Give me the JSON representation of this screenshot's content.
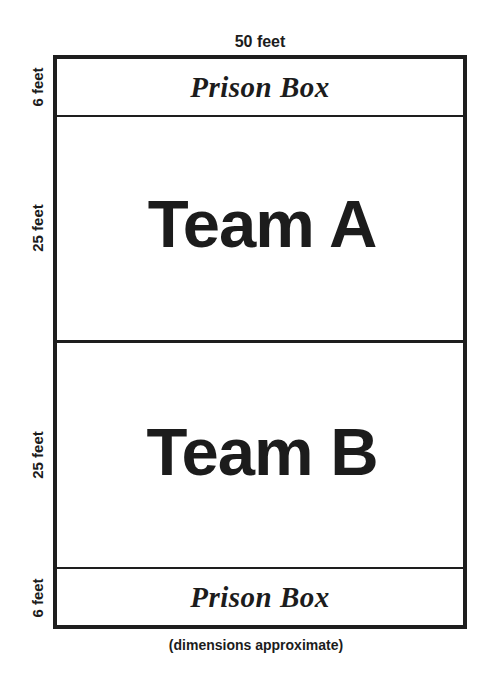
{
  "diagram": {
    "type": "field-layout",
    "dimensions": {
      "width_label": "50 feet",
      "side_labels": [
        "6 feet",
        "25 feet",
        "25 feet",
        "6 feet"
      ]
    },
    "zones": [
      {
        "name": "prison-box-top",
        "label": "Prison Box",
        "depth": "6 feet"
      },
      {
        "name": "team-a",
        "label": "Team A",
        "depth": "25 feet"
      },
      {
        "name": "team-b",
        "label": "Team B",
        "depth": "25 feet"
      },
      {
        "name": "prison-box-bottom",
        "label": "Prison Box",
        "depth": "6 feet"
      }
    ],
    "caption": "(dimensions approximate)",
    "colors": {
      "lines": "#1e1e1e",
      "text": "#1c1c1c",
      "background": "#ffffff"
    }
  }
}
